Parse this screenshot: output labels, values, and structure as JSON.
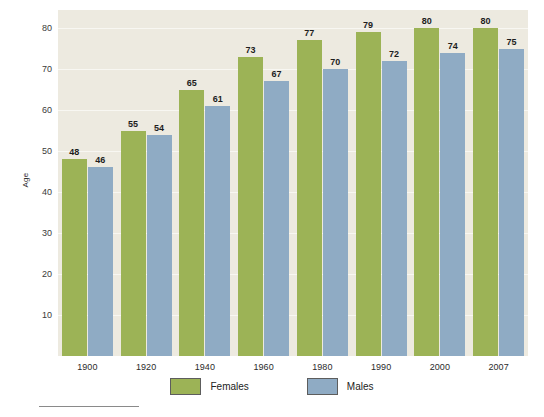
{
  "chart_data": {
    "type": "bar",
    "title": "",
    "xlabel": "",
    "ylabel": "Age",
    "ylim": [
      0,
      85
    ],
    "yticks": [
      10,
      20,
      30,
      40,
      50,
      60,
      70,
      80
    ],
    "grid": true,
    "legend_position": "bottom",
    "categories": [
      "1900",
      "1920",
      "1940",
      "1960",
      "1980",
      "1990",
      "2000",
      "2007"
    ],
    "series": [
      {
        "name": "Females",
        "color": "#9cb356",
        "values": [
          48,
          55,
          65,
          73,
          77,
          79,
          80,
          80
        ]
      },
      {
        "name": "Males",
        "color": "#8fabc4",
        "values": [
          46,
          54,
          61,
          67,
          70,
          72,
          74,
          75
        ]
      }
    ],
    "plot_background": "#edeae0",
    "gridline_color": "#f8f7f2"
  },
  "source": {
    "rule": "",
    "note": ""
  }
}
